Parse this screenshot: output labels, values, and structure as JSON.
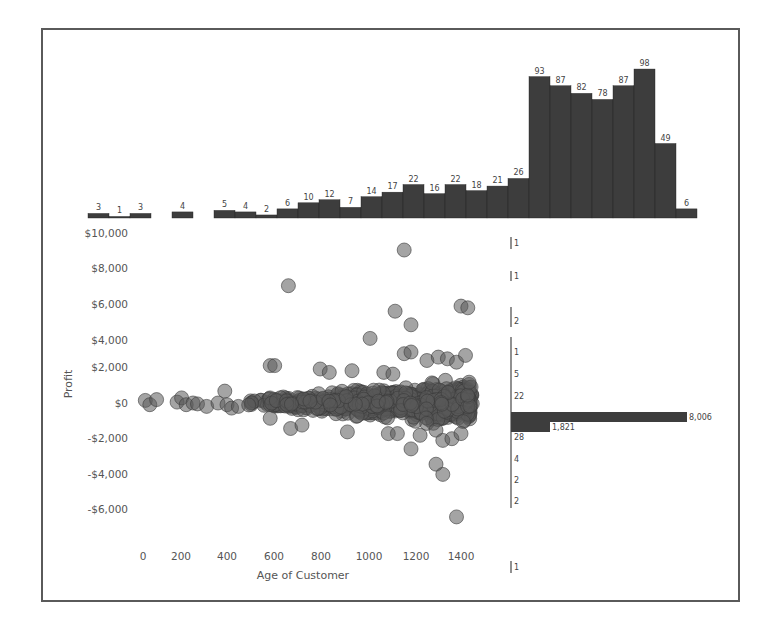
{
  "chart_data": [
    {
      "type": "bar",
      "title": "",
      "description": "Marginal histogram of customer count by Age of Customer bin (top)",
      "bin_width": 50,
      "categories": [
        0,
        50,
        100,
        200,
        300,
        350,
        400,
        450,
        500,
        550,
        600,
        650,
        700,
        750,
        800,
        850,
        900,
        950,
        1000,
        1050,
        1100,
        1150,
        1200,
        1250,
        1300,
        1350,
        1400,
        1450
      ],
      "values": [
        3,
        1,
        3,
        4,
        5,
        4,
        2,
        6,
        10,
        12,
        7,
        14,
        17,
        22,
        16,
        22,
        18,
        21,
        26,
        93,
        87,
        82,
        78,
        87,
        98,
        49,
        6
      ],
      "labels": [
        "3",
        "1",
        "3",
        "4",
        "5",
        "4",
        "2",
        "6",
        "10",
        "12",
        "7",
        "14",
        "17",
        "22",
        "16",
        "22",
        "18",
        "21",
        "26",
        "93",
        "87",
        "82",
        "78",
        "87",
        "98",
        "49",
        "6"
      ]
    },
    {
      "type": "scatter",
      "title": "",
      "xlabel": "Age of Customer",
      "ylabel": "Profit",
      "xlim": [
        0,
        1450
      ],
      "ylim": [
        -8000,
        10000
      ],
      "x_ticks": [
        "0",
        "200",
        "400",
        "600",
        "800",
        "1000",
        "1200",
        "1400"
      ],
      "y_ticks": [
        "$10,000",
        "$8,000",
        "$6,000",
        "$4,000",
        "$2,000",
        "$0",
        "-$2,000",
        "-$4,000",
        "-$6,000"
      ],
      "grid": false,
      "notable_points": [
        {
          "x": 1150,
          "y": 9000
        },
        {
          "x": 640,
          "y": 6900
        },
        {
          "x": 1400,
          "y": 5700
        },
        {
          "x": 1430,
          "y": 5600
        },
        {
          "x": 1110,
          "y": 5400
        },
        {
          "x": 1180,
          "y": 4600
        },
        {
          "x": 1000,
          "y": 3800
        },
        {
          "x": 580,
          "y": 2200
        },
        {
          "x": 1290,
          "y": -3600
        },
        {
          "x": 1320,
          "y": -4200
        },
        {
          "x": 1380,
          "y": -6700
        }
      ]
    },
    {
      "type": "bar",
      "orientation": "horizontal",
      "description": "Marginal histogram of count by Profit bin (right)",
      "categories": [
        "$10,000",
        "$8,000",
        "$6,000",
        "$4,000",
        "$2,000 (upper)",
        "$2,000",
        "$0 (upper)",
        "$0",
        "$0 (lower)",
        "-$2,000",
        "-$4,000",
        "-$4,000 (lower)",
        "-$6,000",
        "-$8,000"
      ],
      "labels": [
        "1",
        "1",
        "2",
        "1",
        "5",
        "22",
        "8,006",
        "1,821",
        "28",
        "4",
        "2",
        "2",
        "1"
      ],
      "values": [
        1,
        1,
        2,
        1,
        5,
        22,
        8006,
        1821,
        28,
        4,
        2,
        2,
        1
      ]
    }
  ],
  "axes": {
    "y_label": "Profit",
    "x_label": "Age of Customer",
    "y_ticks": [
      "$10,000",
      "$8,000",
      "$6,000",
      "$4,000",
      "$2,000",
      "$0",
      "-$2,000",
      "-$4,000",
      "-$6,000"
    ],
    "x_ticks": [
      "0",
      "200",
      "400",
      "600",
      "800",
      "1000",
      "1200",
      "1400"
    ]
  },
  "top_hist": {
    "labels": [
      "3",
      "1",
      "3",
      "4",
      "5",
      "4",
      "2",
      "6",
      "10",
      "12",
      "7",
      "14",
      "17",
      "22",
      "16",
      "22",
      "18",
      "21",
      "26",
      "93",
      "87",
      "82",
      "78",
      "87",
      "98",
      "49",
      "6"
    ]
  },
  "right_hist": {
    "labels": [
      "1",
      "1",
      "2",
      "1",
      "5",
      "22",
      "28",
      "4",
      "2",
      "2",
      "1"
    ],
    "big_label": "8,006",
    "second_label": "1,821"
  },
  "colors": {
    "bar": "#3d3d3d",
    "point_fill": "#5a5a5a",
    "point_stroke": "#3a3a3a",
    "axis": "#555555",
    "frame": "#5a5a5a"
  }
}
